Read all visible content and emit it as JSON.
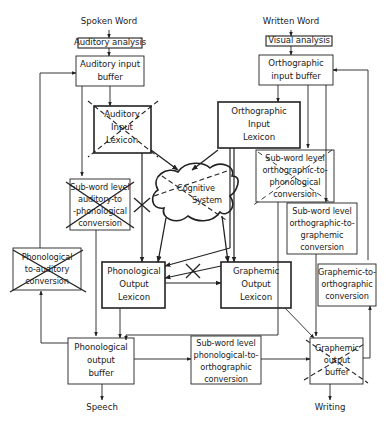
{
  "inputs": {
    "spoken_word": "Spoken Word",
    "written_word": "Written Word"
  },
  "outputs": {
    "speech": "Speech",
    "writing": "Writing"
  },
  "boxes": {
    "auditory_analysis": "Auditory analysis",
    "visual_analysis": "Visual analysis",
    "auditory_input_buffer": [
      "Auditory input",
      "buffer"
    ],
    "orthographic_input_buffer": [
      "Orthographic",
      "input buffer"
    ],
    "auditory_input_lexicon": [
      "Auditory",
      "Input",
      "Lexicon"
    ],
    "orthographic_input_lexicon": [
      "Orthographic",
      "Input",
      "Lexicon"
    ],
    "subword_auditory_to_phonological": [
      "Sub-word level",
      "auditory-to",
      "-phonological",
      "conversion"
    ],
    "subword_orthographic_to_phonological": [
      "Sub-word level",
      "orthographic-to-",
      "phonological",
      "conversion"
    ],
    "subword_orthographic_to_graphemic": [
      "Sub-word level",
      "orthographic-to-",
      "graphemic",
      "conversion"
    ],
    "cognitive_system": [
      "Cognitive",
      "System"
    ],
    "phonological_to_auditory": [
      "Phonological",
      "to-auditory",
      "conversion"
    ],
    "phonological_output_lexicon": [
      "Phonological",
      "Output",
      "Lexicon"
    ],
    "graphemic_output_lexicon": [
      "Graphemic",
      "Output",
      "Lexicon"
    ],
    "graphemic_to_orthographic": [
      "Graphemic-to-",
      "orthographic",
      "conversion"
    ],
    "phonological_output_buffer": [
      "Phonological",
      "output",
      "buffer"
    ],
    "subword_phonological_to_orthographic": [
      "Sub-word level",
      "phonological-to-",
      "orthographic",
      "conversion"
    ],
    "graphemic_output_buffer": [
      "Graphemic",
      "output",
      "buffer"
    ]
  },
  "impaired_components": [
    "Auditory Input Lexicon",
    "Sub-word level auditory-to-phonological conversion",
    "Sub-word level orthographic-to-phonological conversion",
    "Cognitive System",
    "Phonological-to-auditory conversion",
    "Graphemic output buffer"
  ],
  "colors": {
    "line": "#222222",
    "background": "#ffffff"
  }
}
